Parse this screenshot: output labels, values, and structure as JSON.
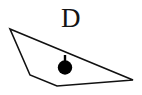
{
  "figure": {
    "label": "D",
    "label_x": 70,
    "label_y": 5,
    "background_color": "#ffffff",
    "stroke_color": "#111111",
    "fill_color": "#ffffff",
    "dot_color": "#000000",
    "stroke_width": 1.6,
    "canvas": {
      "width": 142,
      "height": 95
    },
    "polygon": {
      "name": "quadrilateral-outline",
      "closed": true,
      "points": "10,29 133,80 57,86 30,75",
      "vertices": [
        {
          "id": "apex-left",
          "x": 10,
          "y": 29
        },
        {
          "id": "vertex-right",
          "x": 133,
          "y": 80
        },
        {
          "id": "vertex-bottom",
          "x": 57,
          "y": 86
        },
        {
          "id": "vertex-bottom-left",
          "x": 30,
          "y": 75
        }
      ]
    },
    "stem": {
      "name": "dot-stem",
      "x1": 65,
      "y1": 55,
      "x2": 65,
      "y2": 62,
      "width": 2.4
    },
    "dot": {
      "name": "marked-point",
      "cx": 65,
      "cy": 67.5,
      "r": 7.2
    }
  }
}
